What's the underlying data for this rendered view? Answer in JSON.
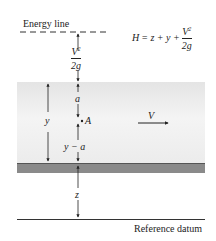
{
  "diagram": {
    "energy_line_label": "Energy line",
    "equation": {
      "lhs": "H",
      "rhs_terms": "= z + y +",
      "frac_num": "V",
      "frac_num_exp": "2",
      "frac_den": "2g"
    },
    "velocity_head": {
      "num": "V",
      "exp": "2",
      "den": "2g"
    },
    "labels": {
      "depth": "y",
      "a": "a",
      "point": "A",
      "y_minus_a": "y − a",
      "elevation": "z",
      "velocity": "V",
      "datum": "Reference datum"
    },
    "colors": {
      "water": "#ececec",
      "bed": "#8a8a8a",
      "line": "#222222"
    }
  }
}
